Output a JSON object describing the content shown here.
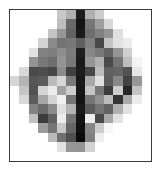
{
  "figure": {
    "kind": "pixelated-grayscale-image",
    "canvas_width": 162,
    "canvas_height": 172,
    "background_color": "#ffffff",
    "frame": {
      "border_color": "#3a3a3a",
      "border_width": 1,
      "left": 9,
      "top": 9,
      "width": 143,
      "height": 153,
      "fill_color": "#ffffff"
    },
    "grid": {
      "columns": 15,
      "rows": 16,
      "cell_width": 9.4,
      "cell_height": 9.44,
      "colormap": "grayscale",
      "value_range": [
        0,
        255
      ]
    }
  },
  "chart_data": {
    "type": "heatmap",
    "title": "",
    "xlabel": "",
    "ylabel": "",
    "colormap": "gray",
    "vmin": 0,
    "vmax": 255,
    "ncols": 15,
    "nrows": 16,
    "values": [
      [
        255,
        255,
        255,
        255,
        255,
        200,
        176,
        28,
        176,
        204,
        255,
        255,
        255,
        255,
        255
      ],
      [
        255,
        255,
        255,
        255,
        255,
        190,
        104,
        20,
        118,
        158,
        216,
        255,
        255,
        255,
        255
      ],
      [
        255,
        255,
        255,
        255,
        196,
        150,
        98,
        26,
        110,
        130,
        148,
        224,
        255,
        255,
        255
      ],
      [
        255,
        255,
        255,
        210,
        140,
        116,
        120,
        96,
        128,
        72,
        196,
        226,
        236,
        255,
        255
      ],
      [
        255,
        255,
        226,
        130,
        126,
        142,
        124,
        30,
        136,
        120,
        100,
        150,
        208,
        255,
        255
      ],
      [
        255,
        255,
        148,
        120,
        110,
        148,
        120,
        26,
        150,
        176,
        74,
        116,
        190,
        244,
        255
      ],
      [
        255,
        216,
        74,
        78,
        70,
        138,
        64,
        30,
        72,
        188,
        96,
        100,
        82,
        230,
        255
      ],
      [
        214,
        180,
        86,
        92,
        186,
        214,
        120,
        24,
        168,
        224,
        92,
        136,
        66,
        150,
        255
      ],
      [
        255,
        196,
        82,
        212,
        236,
        160,
        204,
        22,
        196,
        120,
        60,
        206,
        40,
        196,
        255
      ],
      [
        255,
        216,
        92,
        166,
        210,
        240,
        116,
        20,
        118,
        144,
        188,
        52,
        170,
        236,
        255
      ],
      [
        255,
        255,
        130,
        108,
        140,
        222,
        178,
        26,
        92,
        116,
        98,
        176,
        226,
        255,
        255
      ],
      [
        255,
        255,
        192,
        60,
        96,
        236,
        118,
        20,
        238,
        72,
        168,
        226,
        255,
        255,
        255
      ],
      [
        255,
        255,
        255,
        156,
        118,
        200,
        100,
        16,
        134,
        204,
        246,
        255,
        255,
        255,
        255
      ],
      [
        255,
        255,
        255,
        255,
        186,
        112,
        78,
        10,
        128,
        238,
        255,
        255,
        255,
        255,
        255
      ],
      [
        255,
        255,
        255,
        255,
        255,
        226,
        150,
        148,
        210,
        255,
        255,
        255,
        255,
        255,
        255
      ],
      [
        255,
        255,
        255,
        255,
        255,
        255,
        255,
        255,
        255,
        255,
        255,
        255,
        255,
        255,
        255
      ]
    ]
  }
}
